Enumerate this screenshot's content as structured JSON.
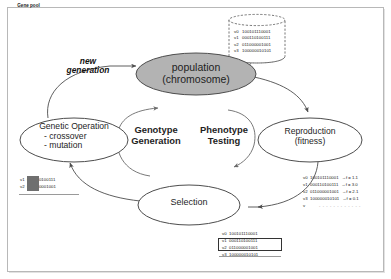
{
  "diagram": {
    "nodes": {
      "population": {
        "line1": "population",
        "line2": "(chromosome)",
        "fill": "#b3b3b3"
      },
      "genetic_operation": {
        "line1": "Genetic Operation",
        "line2": "- crossover",
        "line3": "- mutation"
      },
      "reproduction": {
        "line1": "Reproduction",
        "line2": "(fitness)"
      },
      "selection": {
        "line1": "Selection"
      }
    },
    "center": {
      "genotype_line1": "Genotype",
      "genotype_line2": "Generation",
      "phenotype_line1": "Phenotype",
      "phenotype_line2": "Testing"
    },
    "edge_labels": {
      "new_generation_line1": "new",
      "new_generation_line2": "generation"
    },
    "gene_pool": {
      "title": "Gene pool",
      "rows": [
        {
          "key": "v0",
          "bits": "100101110001"
        },
        {
          "key": "v1",
          "bits": "000110100111"
        },
        {
          "key": "v2",
          "bits": "011000001001"
        },
        {
          "key": "v3",
          "bits": "100000010101"
        }
      ]
    },
    "fitness_table": {
      "rows": [
        {
          "key": "v0",
          "bits": "100101110001",
          "arrow": "→",
          "fitness": "f = 1.1"
        },
        {
          "key": "v1",
          "bits": "000110100111",
          "arrow": "→",
          "fitness": "f = 3.0"
        },
        {
          "key": "v2",
          "bits": "011000001001",
          "arrow": "→",
          "fitness": "f = 2.1"
        },
        {
          "key": "v3",
          "bits": "100000010101",
          "arrow": "→",
          "fitness": "f = 0.1"
        }
      ],
      "continuation_key": "v",
      "continuation_dots": "- - - - - - - - - - - -"
    },
    "selection_table": {
      "rows": [
        {
          "key": "v0",
          "bits": "100101110001",
          "selected": false
        },
        {
          "key": "v1",
          "bits": "000110100111",
          "selected": true
        },
        {
          "key": "v2",
          "bits": "011000001001",
          "selected": true
        },
        {
          "key": "v3",
          "bits": "100000010101",
          "selected": false
        }
      ]
    },
    "crossover_table": {
      "rows": [
        {
          "key": "v1",
          "bits_head": "00011",
          "bits_tail": "0100111"
        },
        {
          "key": "v2",
          "bits_head": "01100",
          "bits_tail": "0001001"
        }
      ]
    },
    "colors": {
      "stroke": "#4d4d4d",
      "population_fill": "#b3b3b3",
      "frame": "#b8b8b8",
      "text": "#1e1e1e"
    }
  }
}
